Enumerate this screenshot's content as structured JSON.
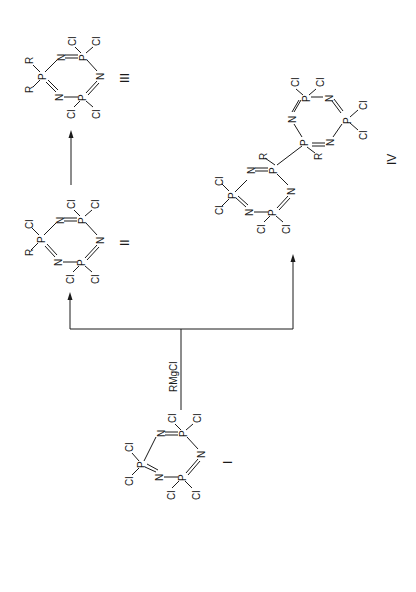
{
  "figure": {
    "orientation": "rotated-90-ccw",
    "reagent": "RMgCl",
    "compounds": [
      {
        "id": "I",
        "label": "I",
        "ring": [
          "P",
          "N",
          "P",
          "N",
          "P",
          "N"
        ],
        "substituents": {
          "p1": [
            "Cl",
            "Cl"
          ],
          "p2": [
            "Cl",
            "Cl"
          ],
          "p3": [
            "Cl",
            "Cl"
          ]
        }
      },
      {
        "id": "II",
        "label": "II",
        "ring": [
          "P",
          "N",
          "P",
          "N",
          "P",
          "N"
        ],
        "substituents": {
          "p1": [
            "R",
            "Cl"
          ],
          "p2": [
            "Cl",
            "Cl"
          ],
          "p3": [
            "Cl",
            "Cl"
          ]
        }
      },
      {
        "id": "III",
        "label": "III",
        "ring": [
          "P",
          "N",
          "P",
          "N",
          "P",
          "N"
        ],
        "substituents": {
          "p1": [
            "R",
            "R"
          ],
          "p2": [
            "Cl",
            "Cl"
          ],
          "p3": [
            "Cl",
            "Cl"
          ]
        }
      },
      {
        "id": "IV",
        "label": "IV",
        "description": "bi(cyclotriphosphazene) linked P-P, each linking P bearing R",
        "ring_a": {
          "linking_p": [
            "R"
          ],
          "other_p": [
            [
              "Cl",
              "Cl"
            ],
            [
              "Cl",
              "Cl"
            ]
          ]
        },
        "ring_b": {
          "linking_p": [
            "R"
          ],
          "other_p": [
            [
              "Cl",
              "Cl"
            ],
            [
              "Cl",
              "Cl"
            ]
          ]
        }
      }
    ],
    "atoms": {
      "P": "P",
      "N": "N",
      "Cl": "Cl",
      "R": "R"
    }
  }
}
